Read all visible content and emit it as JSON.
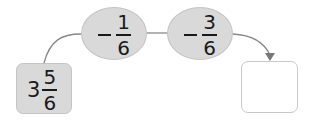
{
  "diagram": {
    "start": {
      "whole": "3",
      "numerator": "5",
      "denominator": "6"
    },
    "steps": [
      {
        "operator": "−",
        "numerator": "1",
        "denominator": "6"
      },
      {
        "operator": "−",
        "numerator": "3",
        "denominator": "6"
      }
    ],
    "result": {
      "value": ""
    },
    "colors": {
      "fill": "#d9d9d9",
      "line": "#777777"
    }
  }
}
